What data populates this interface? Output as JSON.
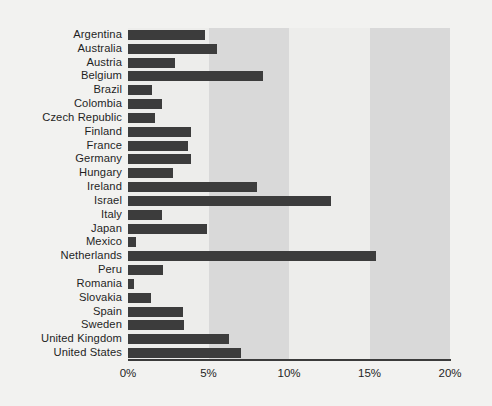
{
  "chart_data": {
    "type": "bar",
    "orientation": "horizontal",
    "title": "",
    "subtitle": "",
    "xlabel": "",
    "ylabel": "",
    "xlim": [
      0,
      20
    ],
    "xunit": "%",
    "grid": false,
    "legend": null,
    "tick_labels": [
      "0%",
      "5%",
      "10%",
      "15%",
      "20%"
    ],
    "tick_values": [
      0,
      5,
      10,
      15,
      20
    ],
    "categories": [
      "Argentina",
      "Australia",
      "Austria",
      "Belgium",
      "Brazil",
      "Colombia",
      "Czech Republic",
      "Finland",
      "France",
      "Germany",
      "Hungary",
      "Ireland",
      "Israel",
      "Italy",
      "Japan",
      "Mexico",
      "Netherlands",
      "Peru",
      "Romania",
      "Slovakia",
      "Spain",
      "Sweden",
      "United Kingdom",
      "United States"
    ],
    "values": [
      4.8,
      5.5,
      2.9,
      8.4,
      1.5,
      2.1,
      1.7,
      3.9,
      3.7,
      3.9,
      2.8,
      8.0,
      12.6,
      2.1,
      4.9,
      0.5,
      15.4,
      2.2,
      0.4,
      1.4,
      3.4,
      3.5,
      6.3,
      7.0
    ]
  },
  "style": {
    "bar_color": "#3c3c3c",
    "band_dark_color": "#d9d9d9",
    "band_light_color": "#ededeb",
    "canvas_color": "#f2f2f0",
    "axis_color": "#3b3b3b",
    "text_color": "#1f1f1f"
  }
}
